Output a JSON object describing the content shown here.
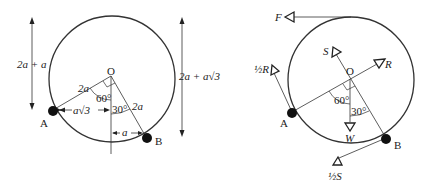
{
  "figure_left": {
    "title": "Geometry of rod AB in a circle",
    "center_label": "O",
    "point_a_label": "A",
    "point_b_label": "B",
    "radius_label_oa": "2a",
    "radius_label_ob": "2a",
    "angle_aov_label": "60°",
    "angle_bov_label": "30°",
    "horiz_dist_a_label": "a√3",
    "horiz_dist_b_label": "a",
    "height_a_label": "2a + a",
    "height_b_label": "2a + a√3"
  },
  "figure_right": {
    "title": "Forces acting on rod AB",
    "center_label": "O",
    "point_a_label": "A",
    "point_b_label": "B",
    "angle_aov_label": "60°",
    "angle_bov_label": "30°",
    "forces": {
      "F": "F",
      "S": "S",
      "R": "R",
      "half_R": "½R",
      "W": "W",
      "half_S": "½S"
    }
  }
}
